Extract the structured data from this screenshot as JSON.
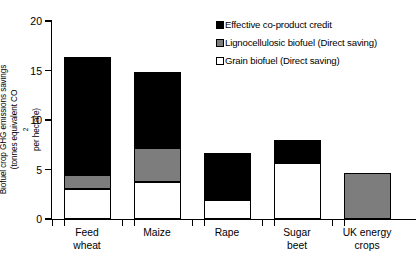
{
  "chart_data": {
    "type": "bar",
    "title": "",
    "subtitle": "",
    "xlabel": "",
    "ylabel": "Biofuel crop GHG emissions savings (tonnes equivalent CO2 per hectare)",
    "ylabel_line1": "Biofuel crop GHG emissions savings",
    "ylabel_line2_pre": "(tonnes equivalent CO",
    "ylabel_line2_sub": "2",
    "ylabel_line2_post": " per hectare)",
    "ylim": [
      0,
      20
    ],
    "yticks": [
      0,
      5,
      10,
      15,
      20
    ],
    "ytick_labels": [
      "0",
      "5",
      "10",
      "15",
      "20"
    ],
    "grid": false,
    "stacked": true,
    "legend_position": "top-right",
    "categories": [
      "Feed wheat",
      "Maize",
      "Rape",
      "Sugar beet",
      "UK energy crops"
    ],
    "category_lines": [
      [
        "Feed",
        "wheat"
      ],
      [
        "Maize",
        ""
      ],
      [
        "Rape",
        ""
      ],
      [
        "Sugar",
        "beet"
      ],
      [
        "UK  energy",
        "crops"
      ]
    ],
    "series": [
      {
        "name": "Grain biofuel (Direct saving)",
        "color": "#ffffff",
        "values": [
          3.0,
          3.7,
          1.9,
          5.7,
          0
        ]
      },
      {
        "name": "Lignocellulosic biofuel (Direct saving)",
        "color": "#7d7d7d",
        "values": [
          1.4,
          3.5,
          0,
          0,
          4.6
        ]
      },
      {
        "name": "Effective co-product credit",
        "color": "#000000",
        "values": [
          12.0,
          7.6,
          4.8,
          2.3,
          0
        ]
      }
    ],
    "totals": [
      16.4,
      14.8,
      6.7,
      8.0,
      4.6
    ]
  },
  "legend": {
    "items": [
      {
        "label": "Effective co-product credit",
        "swatch": "black"
      },
      {
        "label": "Lignocellulosic biofuel (Direct saving)",
        "swatch": "gray"
      },
      {
        "label": "Grain biofuel (Direct saving)",
        "swatch": "white"
      }
    ]
  }
}
